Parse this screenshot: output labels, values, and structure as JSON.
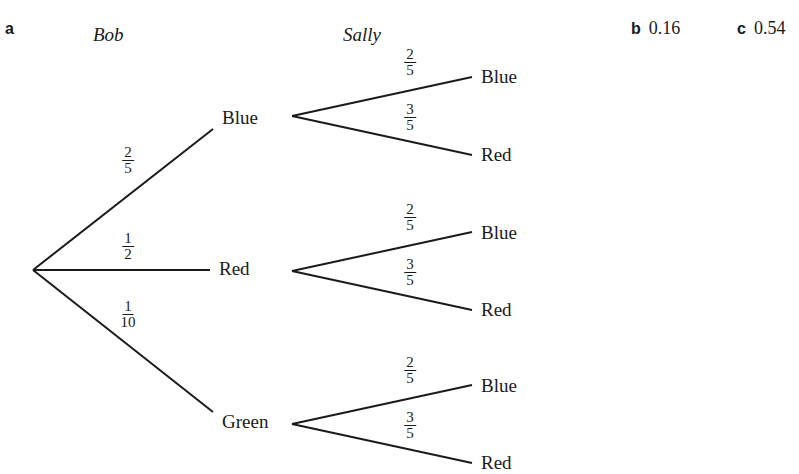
{
  "part_a": {
    "label": "a"
  },
  "part_b": {
    "label": "b",
    "answer": "0.16"
  },
  "part_c": {
    "label": "c",
    "answer": "0.54"
  },
  "headers": {
    "first": "Bob",
    "second": "Sally"
  },
  "bob": {
    "blue": {
      "label": "Blue",
      "num": "2",
      "den": "5"
    },
    "red": {
      "label": "Red",
      "num": "1",
      "den": "2"
    },
    "green": {
      "label": "Green",
      "num": "1",
      "den": "10"
    }
  },
  "sally": {
    "after_blue": {
      "blue": {
        "label": "Blue",
        "num": "2",
        "den": "5"
      },
      "red": {
        "label": "Red",
        "num": "3",
        "den": "5"
      }
    },
    "after_red": {
      "blue": {
        "label": "Blue",
        "num": "2",
        "den": "5"
      },
      "red": {
        "label": "Red",
        "num": "3",
        "den": "5"
      }
    },
    "after_green": {
      "blue": {
        "label": "Blue",
        "num": "2",
        "den": "5"
      },
      "red": {
        "label": "Red",
        "num": "3",
        "den": "5"
      }
    }
  }
}
